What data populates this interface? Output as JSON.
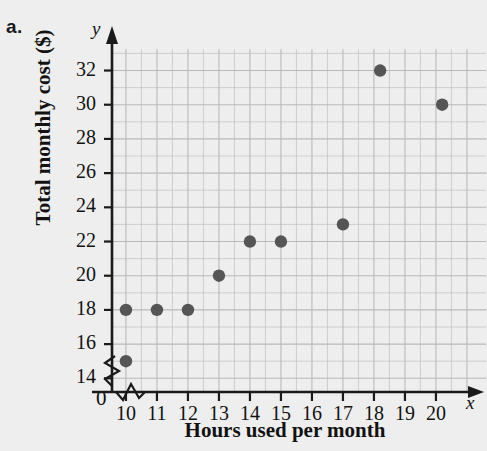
{
  "part_label": "a.",
  "chart_data": {
    "type": "scatter",
    "title": "",
    "xlabel": "Hours used per month",
    "ylabel": "Total monthly cost ($)",
    "x_axis_variable": "x",
    "y_axis_variable": "y",
    "origin_label": "0",
    "xlim": [
      9.4,
      20.9
    ],
    "ylim": [
      13.2,
      32.9
    ],
    "xticks": [
      10,
      11,
      12,
      13,
      14,
      15,
      16,
      17,
      18,
      19,
      20
    ],
    "yticks": [
      14,
      16,
      18,
      20,
      22,
      24,
      26,
      28,
      30,
      32
    ],
    "xtick_labels": [
      "10",
      "11",
      "12",
      "13",
      "14",
      "15",
      "16",
      "17",
      "18",
      "19",
      "20"
    ],
    "ytick_labels": [
      "14",
      "16",
      "18",
      "20",
      "22",
      "24",
      "26",
      "28",
      "30",
      "32"
    ],
    "grid": true,
    "axis_break_x": true,
    "axis_break_y": true,
    "legend": null,
    "points": [
      {
        "x": 10,
        "y": 15
      },
      {
        "x": 10,
        "y": 18
      },
      {
        "x": 11,
        "y": 18
      },
      {
        "x": 12,
        "y": 18
      },
      {
        "x": 13,
        "y": 20
      },
      {
        "x": 14,
        "y": 22
      },
      {
        "x": 15,
        "y": 22
      },
      {
        "x": 17,
        "y": 23
      },
      {
        "x": 18.2,
        "y": 32
      },
      {
        "x": 20.2,
        "y": 30
      }
    ]
  },
  "colors": {
    "background": "#eeeeee",
    "grid": "#b9b9b9",
    "axis": "#1a1a1a",
    "point": "#555555",
    "text": "#121212"
  }
}
